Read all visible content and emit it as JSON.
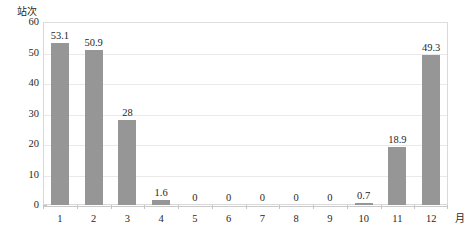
{
  "chart_data": {
    "type": "bar",
    "title": "",
    "subtitle": "",
    "xlabel": "月",
    "ylabel": "站次",
    "categories": [
      "1",
      "2",
      "3",
      "4",
      "5",
      "6",
      "7",
      "8",
      "9",
      "10",
      "11",
      "12"
    ],
    "values": [
      53.1,
      50.9,
      28,
      1.6,
      0,
      0,
      0,
      0,
      0,
      0.7,
      18.9,
      49.3
    ],
    "value_labels": [
      "53.1",
      "50.9",
      "28",
      "1.6",
      "0",
      "0",
      "0",
      "0",
      "0",
      "0.7",
      "18.9",
      "49.3"
    ],
    "series": [
      {
        "name": "站次",
        "values": [
          53.1,
          50.9,
          28,
          1.6,
          0,
          0,
          0,
          0,
          0,
          0.7,
          18.9,
          49.3
        ],
        "color": "#969696"
      }
    ],
    "ylim": [
      0,
      60
    ],
    "ytick_values": [
      0,
      10,
      20,
      30,
      40,
      50,
      60
    ],
    "ytick_labels": [
      "0",
      "10",
      "20",
      "30",
      "40",
      "50",
      "60"
    ],
    "xlim_categories": 12,
    "grid": true,
    "grid_axis": "y",
    "legend": false,
    "legend_position": "none",
    "bar_color": "#969696",
    "grid_color": "#e9e9e9",
    "frame_color": "#d9d9d9",
    "background": "#ffffff",
    "show_data_labels": true,
    "data_label_position": "outside-end"
  },
  "axes": {
    "y_unit_caption": "站次",
    "x_unit_caption": "月"
  }
}
